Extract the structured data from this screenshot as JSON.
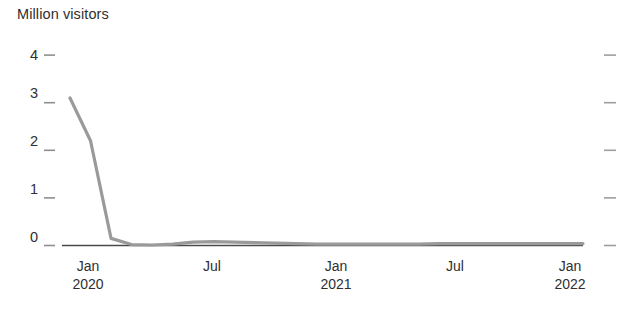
{
  "chart_data": {
    "type": "line",
    "title": "Million visitors",
    "xlabel": "",
    "ylabel": "Million visitors",
    "ylim": [
      0,
      4
    ],
    "grid": false,
    "legend": "none",
    "line_color": "#9a9a9a",
    "axis_color": "#4a4a4a",
    "text_color": "#2f2f2f",
    "y_ticks": [
      "4",
      "3",
      "2",
      "1",
      "0"
    ],
    "y_tick_values": [
      4,
      3,
      2,
      1,
      0
    ],
    "right_axis_ticks": [
      4,
      3,
      2,
      1,
      0
    ],
    "x_ticks": [
      {
        "month": "Jan",
        "year": "2020"
      },
      {
        "month": "Jul",
        "year": ""
      },
      {
        "month": "Jan",
        "year": "2021"
      },
      {
        "month": "Jul",
        "year": ""
      },
      {
        "month": "Jan",
        "year": "2022"
      }
    ],
    "x": [
      "2020-01",
      "2020-02",
      "2020-03",
      "2020-04",
      "2020-05",
      "2020-06",
      "2020-07",
      "2020-08",
      "2020-09",
      "2020-10",
      "2020-11",
      "2020-12",
      "2021-01",
      "2021-02",
      "2021-03",
      "2021-04",
      "2021-05",
      "2021-06",
      "2021-07",
      "2021-08",
      "2021-09",
      "2021-10",
      "2021-11",
      "2021-12",
      "2022-01",
      "2022-02"
    ],
    "series": [
      {
        "name": "Million visitors",
        "values": [
          3.1,
          2.2,
          0.15,
          0.02,
          0.01,
          0.03,
          0.07,
          0.08,
          0.07,
          0.06,
          0.05,
          0.04,
          0.03,
          0.03,
          0.03,
          0.03,
          0.03,
          0.03,
          0.04,
          0.04,
          0.04,
          0.04,
          0.04,
          0.04,
          0.04,
          0.04
        ]
      }
    ]
  }
}
